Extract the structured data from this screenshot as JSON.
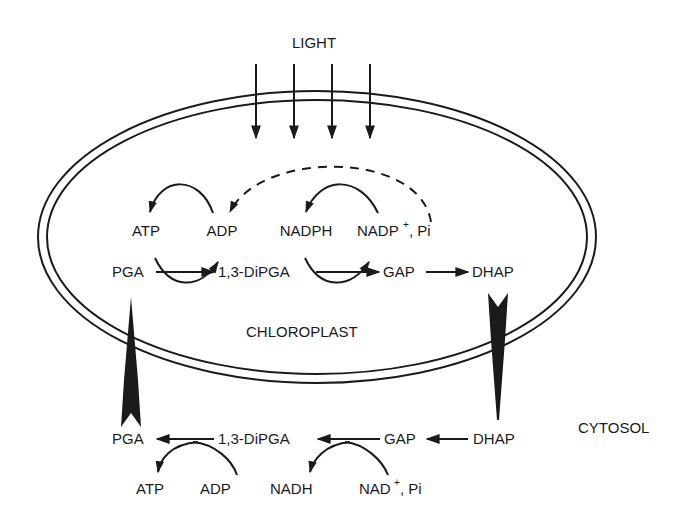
{
  "diagram": {
    "light_label": "LIGHT",
    "compartments": {
      "chloroplast": "CHLOROPLAST",
      "cytosol": "CYTOSOL"
    },
    "chloroplast_pathway": {
      "cofactors_top": {
        "atp": "ATP",
        "adp": "ADP",
        "nadph": "NADPH",
        "nadp": "NADP",
        "nadp_sup": "+",
        "nadp_suffix": ", Pi"
      },
      "metabolites": {
        "pga": "PGA",
        "dipga": "1,3-DiPGA",
        "gap": "GAP",
        "dhap": "DHAP"
      }
    },
    "cytosol_pathway": {
      "metabolites": {
        "pga": "PGA",
        "dipga": "1,3-DiPGA",
        "gap": "GAP",
        "dhap": "DHAP"
      },
      "cofactors_bottom": {
        "atp": "ATP",
        "adp": "ADP",
        "nadh": "NADH",
        "nad": "NAD",
        "nad_sup": "+",
        "nad_suffix": ", Pi"
      }
    },
    "colors": {
      "ink": "#1a1a1a",
      "background": "#ffffff"
    }
  }
}
